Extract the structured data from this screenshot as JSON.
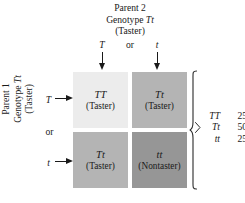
{
  "diagram": {
    "type": "punnett-square",
    "parent2": {
      "line1": "Parent 2",
      "line2_prefix": "Genotype ",
      "line2_genotype": "Tt",
      "line3": "(Taster)",
      "allele_left": "T",
      "allele_right": "t",
      "or_label": "or"
    },
    "parent1": {
      "line1": "Parent 1",
      "line2_prefix": "Genotype ",
      "line2_genotype": "Tt",
      "line3": "(Taster)",
      "allele_top": "T",
      "allele_bottom": "t",
      "or_label": "or"
    },
    "cells": [
      {
        "id": "top-left",
        "genotype": "TT",
        "phenotype": "(Taster)",
        "color": "#ececec"
      },
      {
        "id": "top-right",
        "genotype": "Tt",
        "phenotype": "(Taster)",
        "color": "#b4b4b4"
      },
      {
        "id": "bottom-left",
        "genotype": "Tt",
        "phenotype": "(Taster)",
        "color": "#b4b4b4"
      },
      {
        "id": "bottom-right",
        "genotype": "tt",
        "phenotype": "(Nontaster)",
        "color": "#969696"
      }
    ],
    "legend": {
      "rows": [
        {
          "genotype": "TT",
          "percent": "25%"
        },
        {
          "genotype": "Tt",
          "percent": "50%"
        },
        {
          "genotype": "tt",
          "percent": "25%"
        }
      ]
    },
    "icons": {
      "arrow_down": "arrow-down-icon",
      "arrow_right": "arrow-right-icon",
      "brace": "curly-brace-icon"
    }
  }
}
